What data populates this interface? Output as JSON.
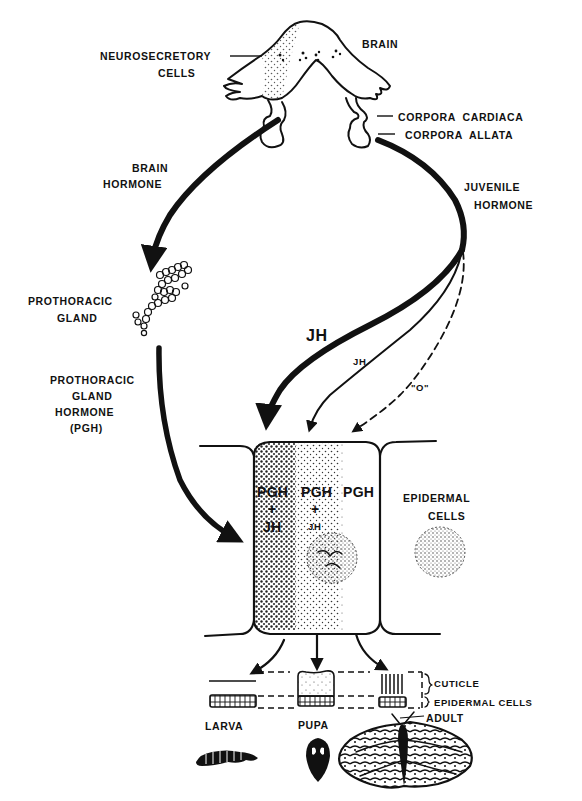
{
  "diagram": {
    "colors": {
      "ink": "#111111",
      "paper": "#ffffff",
      "stipple": "#222222"
    },
    "labels": {
      "brain": "BRAIN",
      "neurosecretory_1": "NEUROSECRETORY",
      "neurosecretory_2": "CELLS",
      "corpora_cardiaca": "CORPORA  CARDIACA",
      "corpora_allata": "CORPORA  ALLATA",
      "brain_hormone_1": "BRAIN",
      "brain_hormone_2": "HORMONE",
      "juvenile_hormone_1": "JUVENILE",
      "juvenile_hormone_2": "HORMONE",
      "prothoracic_gland_1": "PROTHORACIC",
      "prothoracic_gland_2": "GLAND",
      "pgh_1": "PROTHORACIC",
      "pgh_2": "GLAND",
      "pgh_3": "HORMONE",
      "pgh_4": "(PGH)",
      "jh_high": "JH",
      "jh_low": "JH",
      "jh_zero": "\"O\"",
      "epidermal_cells_1": "EPIDERMAL",
      "epidermal_cells_2": "CELLS",
      "cuticle": "CUTICLE",
      "epidermal_layer": "EPIDERMAL CELLS",
      "larva": "LARVA",
      "pupa": "PUPA",
      "adult": "ADULT"
    },
    "cell_zones": [
      {
        "line1": "PGH",
        "line2": "+",
        "line3": "JH",
        "jh_level": "high",
        "outcome": "LARVA"
      },
      {
        "line1": "PGH",
        "line2": "+",
        "line3": "JH",
        "jh_level": "low",
        "outcome": "PUPA"
      },
      {
        "line1": "PGH",
        "line2": "",
        "line3": "",
        "jh_level": "none",
        "outcome": "ADULT"
      }
    ],
    "flows": [
      {
        "from": "neurosecretory cells",
        "to": "prothoracic gland",
        "label": "BRAIN HORMONE",
        "style": "thick"
      },
      {
        "from": "prothoracic gland",
        "to": "epidermal cell",
        "label": "PGH",
        "style": "thick"
      },
      {
        "from": "corpora allata",
        "to": "epidermal cell (larval zone)",
        "label": "JH",
        "style": "thick"
      },
      {
        "from": "corpora allata",
        "to": "epidermal cell (pupal zone)",
        "label": "JH",
        "style": "thin"
      },
      {
        "from": "corpora allata",
        "to": "epidermal cell (adult zone)",
        "label": "\"O\"",
        "style": "dashed"
      }
    ]
  }
}
